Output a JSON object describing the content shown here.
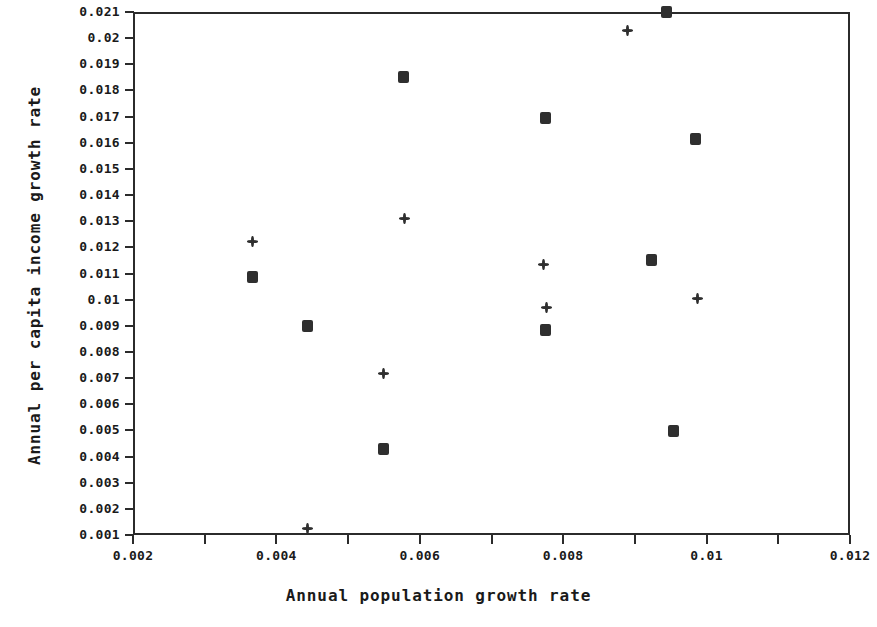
{
  "chart_data": {
    "type": "scatter",
    "title": "",
    "xlabel": "Annual population growth rate",
    "ylabel": "Annual per capita income growth rate",
    "xlim": [
      0.002,
      0.012
    ],
    "ylim": [
      0.001,
      0.021
    ],
    "grid": false,
    "legend": "none",
    "xticks": [
      0.002,
      0.004,
      0.006,
      0.008,
      0.01,
      0.012
    ],
    "xtick_labels": [
      "0.002",
      "0.004",
      "0.006",
      "0.008",
      "0.01",
      "0.012"
    ],
    "xminor_step": 0.001,
    "yticks": [
      0.001,
      0.002,
      0.003,
      0.004,
      0.005,
      0.006,
      0.007,
      0.008,
      0.009,
      0.01,
      0.011,
      0.012,
      0.013,
      0.014,
      0.015,
      0.016,
      0.017,
      0.018,
      0.019,
      0.02,
      0.021
    ],
    "ytick_labels": [
      "0.001",
      "0.002",
      "0.003",
      "0.004",
      "0.005",
      "0.006",
      "0.007",
      "0.008",
      "0.009",
      "0.01",
      "0.011",
      "0.012",
      "0.013",
      "0.014",
      "0.015",
      "0.016",
      "0.017",
      "0.018",
      "0.019",
      "0.02",
      "0.021"
    ],
    "series": [
      {
        "name": "square-series",
        "marker": "square",
        "color": "#2f2f2f",
        "points": [
          {
            "x": 0.00367,
            "y": 0.01086
          },
          {
            "x": 0.00444,
            "y": 0.00901
          },
          {
            "x": 0.00549,
            "y": 0.00429
          },
          {
            "x": 0.00577,
            "y": 0.01852
          },
          {
            "x": 0.00775,
            "y": 0.00883
          },
          {
            "x": 0.00775,
            "y": 0.01695
          },
          {
            "x": 0.00923,
            "y": 0.0115
          },
          {
            "x": 0.00944,
            "y": 0.021
          },
          {
            "x": 0.00954,
            "y": 0.00498
          },
          {
            "x": 0.00985,
            "y": 0.01614
          }
        ]
      },
      {
        "name": "plus-series",
        "marker": "plus",
        "color": "#2f2f2f",
        "points": [
          {
            "x": 0.00367,
            "y": 0.01224
          },
          {
            "x": 0.00443,
            "y": 0.00123
          },
          {
            "x": 0.00549,
            "y": 0.00719
          },
          {
            "x": 0.00579,
            "y": 0.01312
          },
          {
            "x": 0.00773,
            "y": 0.01133
          },
          {
            "x": 0.00777,
            "y": 0.00969
          },
          {
            "x": 0.0089,
            "y": 0.02029
          },
          {
            "x": 0.00988,
            "y": 0.01006
          }
        ]
      }
    ]
  }
}
